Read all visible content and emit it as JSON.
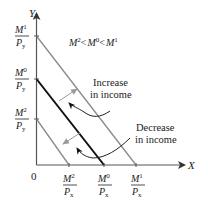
{
  "diagram": {
    "axes": {
      "x_label": "X",
      "y_label": "Y",
      "origin_label": "0"
    },
    "condition": {
      "parts": [
        {
          "base": "M",
          "sup": "2"
        },
        {
          "op": "<"
        },
        {
          "base": "M",
          "sup": "0"
        },
        {
          "op": "<"
        },
        {
          "base": "M",
          "sup": "1"
        }
      ],
      "text": "M2 < M0 < M1"
    },
    "y_intercepts": [
      {
        "id": "M1",
        "num": "M",
        "sup": "1",
        "den": "P",
        "sub": "y",
        "level": 1
      },
      {
        "id": "M0",
        "num": "M",
        "sup": "0",
        "den": "P",
        "sub": "y",
        "level": 0
      },
      {
        "id": "M2",
        "num": "M",
        "sup": "2",
        "den": "P",
        "sub": "y",
        "level": 2
      }
    ],
    "x_intercepts": [
      {
        "id": "M2",
        "num": "M",
        "sup": "2",
        "den": "P",
        "sub": "x"
      },
      {
        "id": "M0",
        "num": "M",
        "sup": "0",
        "den": "P",
        "sub": "x"
      },
      {
        "id": "M1",
        "num": "M",
        "sup": "1",
        "den": "P",
        "sub": "x"
      }
    ],
    "budget_lines": [
      {
        "id": "M1",
        "relative_income": 1.31,
        "style": "gray"
      },
      {
        "id": "M0",
        "relative_income": 1.0,
        "style": "black"
      },
      {
        "id": "M2",
        "relative_income": 0.46,
        "style": "gray"
      }
    ],
    "annotations": {
      "increase_line1": "Increase",
      "increase_line2": "in income",
      "decrease_line1": "Decrease",
      "decrease_line2": "in income"
    },
    "colors": {
      "axis": "#555555",
      "base_line": "#111111",
      "shifted_line": "#8a8a8a",
      "shift_arrow": "#9a9a9a",
      "pointer": "#222222"
    }
  }
}
